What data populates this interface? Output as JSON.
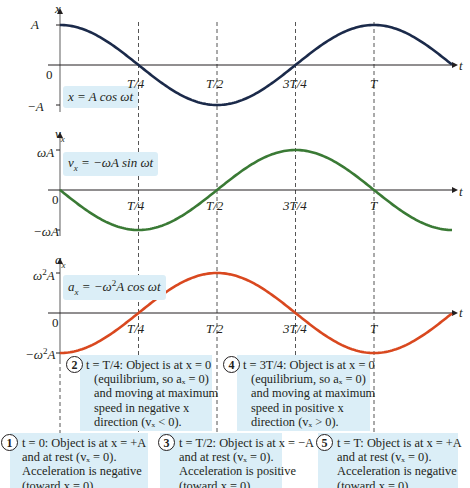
{
  "chart_data": [
    {
      "type": "line",
      "title": "Position vs time",
      "ylabel": "x",
      "xlabel": "t",
      "equation": "x = A cos ωt",
      "color": "#1b2a4a",
      "y_ticks": [
        "A",
        "0",
        "−A"
      ],
      "x_ticks": [
        "T/4",
        "T/2",
        "3T/4",
        "T"
      ],
      "x": [
        0,
        0.25,
        0.5,
        0.75,
        1.0,
        1.25
      ],
      "values": [
        1,
        0,
        -1,
        0,
        1,
        0
      ]
    },
    {
      "type": "line",
      "title": "Velocity vs time",
      "ylabel": "v_x",
      "xlabel": "t",
      "equation": "v_x = −ωA sin ωt",
      "color": "#3a7a35",
      "y_ticks": [
        "ωA",
        "0",
        "−ωA"
      ],
      "x_ticks": [
        "T/4",
        "T/2",
        "3T/4",
        "T"
      ],
      "x": [
        0,
        0.25,
        0.5,
        0.75,
        1.0,
        1.25
      ],
      "values": [
        0,
        -1,
        0,
        1,
        0,
        -1
      ]
    },
    {
      "type": "line",
      "title": "Acceleration vs time",
      "ylabel": "a_x",
      "xlabel": "t",
      "equation": "a_x = −ω²A cos ωt",
      "color": "#d9481f",
      "y_ticks": [
        "ω²A",
        "0",
        "−ω²A"
      ],
      "x_ticks": [
        "T/4",
        "T/2",
        "3T/4",
        "T"
      ],
      "x": [
        0,
        0.25,
        0.5,
        0.75,
        1.0,
        1.25
      ],
      "values": [
        -1,
        0,
        1,
        0,
        -1,
        0
      ]
    }
  ],
  "plots": {
    "x": {
      "axis": "x",
      "max": "A",
      "zero": "0",
      "min": "−A",
      "eq_lhs": "x",
      "eq_rhs": " = A cos ωt",
      "t": "t"
    },
    "v": {
      "axis": "v",
      "axis_sub": "x",
      "max": "ωA",
      "zero": "0",
      "min": "−ωA",
      "eq_lhs": "v",
      "eq_sub": "x",
      "eq_rhs": " = −ωA sin ωt",
      "t": "t"
    },
    "a": {
      "axis": "a",
      "axis_sub": "x",
      "max_pre": "ω",
      "max_sup": "2",
      "max_post": "A",
      "zero": "0",
      "min_pre": "−ω",
      "min_sup": "2",
      "min_post": "A",
      "eq_lhs": "a",
      "eq_sub": "x",
      "eq_rhs_pre": " = −ω",
      "eq_rhs_sup": "2",
      "eq_rhs_post": "A cos ωt",
      "t": "t"
    }
  },
  "ticks": {
    "t1": "T/4",
    "t2": "T/2",
    "t3": "3T/4",
    "t4": "T"
  },
  "notes": [
    {
      "num": "1",
      "lines": [
        "t = 0: Object is at x = +A",
        "and at rest (vₓ = 0).",
        "Acceleration is negative",
        "(toward x = 0)."
      ]
    },
    {
      "num": "2",
      "lines": [
        "t = T/4: Object is at x = 0",
        "(equilibrium, so aₓ = 0)",
        "and moving at maximum",
        "speed in negative x",
        "direction (vₓ < 0)."
      ]
    },
    {
      "num": "3",
      "lines": [
        "t = T/2: Object is at x = −A",
        "and at rest (vₓ = 0).",
        "Acceleration is positive",
        "(toward x = 0)."
      ]
    },
    {
      "num": "4",
      "lines": [
        "t = 3T/4: Object is at x = 0",
        "(equilibrium, so aₓ = 0)",
        "and moving at maximum",
        "speed in positive x",
        "direction (vₓ > 0)."
      ]
    },
    {
      "num": "5",
      "lines": [
        "t = T: Object is at x = +A",
        "and at rest (vₓ = 0).",
        "Acceleration is negative",
        "(toward x = 0)."
      ]
    }
  ],
  "colors": {
    "position": "#1b2a4a",
    "velocity": "#3a7a35",
    "acceleration": "#d9481f",
    "box": "#dbeef7",
    "axis": "#231f20",
    "dash": "#555555"
  }
}
